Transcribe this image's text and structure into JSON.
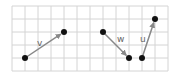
{
  "diagram": {
    "grid": {
      "x0": 12,
      "y0": 6,
      "cell": 13,
      "cols": 12,
      "rows": 5,
      "color": "#d4d4d4"
    },
    "vectors": [
      {
        "label": "v",
        "from": [
          25,
          58
        ],
        "to": [
          64,
          32
        ],
        "label_pos": [
          37,
          46
        ]
      },
      {
        "label": "w",
        "from": [
          103,
          32
        ],
        "to": [
          129,
          58
        ],
        "label_pos": [
          117,
          42
        ]
      },
      {
        "label": "u",
        "from": [
          142,
          58
        ],
        "to": [
          155,
          19
        ],
        "label_pos": [
          140,
          42
        ]
      }
    ],
    "colors": {
      "arrow": "#888888",
      "point": "#111111"
    }
  }
}
